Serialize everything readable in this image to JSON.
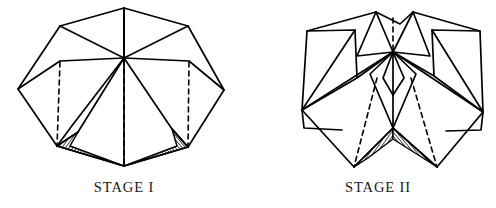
{
  "document": {
    "title": "Origami Folding Stages",
    "background_color": "#ffffff",
    "line_color": "#000000",
    "hatch_color": "#2b2b2b"
  },
  "captions": {
    "left": "STAGE I",
    "right": "STAGE II"
  },
  "figures": [
    {
      "name": "stage-1-figure",
      "label": "STAGE I",
      "description": "Partially folded polyhedral net with central hub, six radiating panels, three dashed valley-fold lines and two hatched shaded triangles at the bottom",
      "hub": [
        124,
        58
      ],
      "top_apex": [
        124,
        8
      ],
      "bottom_apex": [
        124,
        166
      ],
      "left_tip": [
        18,
        89
      ],
      "right_tip": [
        224,
        90
      ],
      "solid_polylines": [
        [
          [
            124,
            8
          ],
          [
            60,
            26
          ],
          [
            124,
            58
          ]
        ],
        [
          [
            124,
            8
          ],
          [
            188,
            26
          ],
          [
            124,
            58
          ]
        ],
        [
          [
            124,
            8
          ],
          [
            124,
            58
          ]
        ],
        [
          [
            60,
            26
          ],
          [
            18,
            89
          ]
        ],
        [
          [
            188,
            26
          ],
          [
            224,
            90
          ]
        ],
        [
          [
            18,
            89
          ],
          [
            57,
            146
          ]
        ],
        [
          [
            224,
            90
          ],
          [
            188,
            147
          ]
        ],
        [
          [
            18,
            89
          ],
          [
            59,
            60
          ]
        ],
        [
          [
            224,
            90
          ],
          [
            189,
            60
          ]
        ],
        [
          [
            59,
            60
          ],
          [
            124,
            58
          ]
        ],
        [
          [
            189,
            60
          ],
          [
            124,
            58
          ]
        ],
        [
          [
            59,
            60
          ],
          [
            60,
            62
          ]
        ],
        [
          [
            124,
            58
          ],
          [
            71,
            127
          ]
        ],
        [
          [
            124,
            58
          ],
          [
            78,
            132
          ]
        ],
        [
          [
            124,
            58
          ],
          [
            172,
            129
          ]
        ],
        [
          [
            124,
            58
          ],
          [
            124,
            166
          ]
        ],
        [
          [
            71,
            127
          ],
          [
            57,
            146
          ]
        ],
        [
          [
            172,
            129
          ],
          [
            188,
            147
          ]
        ],
        [
          [
            57,
            146
          ],
          [
            124,
            166
          ]
        ],
        [
          [
            188,
            147
          ],
          [
            124,
            166
          ]
        ],
        [
          [
            57,
            146
          ],
          [
            78,
            132
          ]
        ],
        [
          [
            172,
            129
          ],
          [
            186,
            146
          ]
        ]
      ],
      "dashed_lines": [
        [
          [
            60,
            62
          ],
          [
            57,
            146
          ]
        ],
        [
          [
            124,
            60
          ],
          [
            124,
            166
          ]
        ],
        [
          [
            189,
            62
          ],
          [
            188,
            147
          ]
        ]
      ],
      "hatched_triangles": [
        [
          [
            78,
            132
          ],
          [
            57,
            146
          ],
          [
            124,
            166
          ]
        ],
        [
          [
            172,
            129
          ],
          [
            188,
            147
          ],
          [
            124,
            166
          ]
        ]
      ]
    },
    {
      "name": "stage-2-figure",
      "label": "STAGE II",
      "description": "Further folded configuration with two outer square panels, inner peaked panels, two dashed valley-fold lines and a dark hatched V-shaped trough at bottom center",
      "hub": [
        393,
        52
      ],
      "left_square": [
        [
          307,
          31
        ],
        [
          355,
          30
        ],
        [
          357,
          78
        ],
        [
          302,
          110
        ]
      ],
      "right_square": [
        [
          432,
          30
        ],
        [
          480,
          31
        ],
        [
          483,
          112
        ],
        [
          434,
          76
        ]
      ],
      "solid_polylines": [
        [
          [
            376,
            12
          ],
          [
            393,
            52
          ]
        ],
        [
          [
            376,
            12
          ],
          [
            307,
            31
          ]
        ],
        [
          [
            307,
            31
          ],
          [
            355,
            30
          ]
        ],
        [
          [
            355,
            30
          ],
          [
            357,
            78
          ]
        ],
        [
          [
            357,
            78
          ],
          [
            302,
            110
          ]
        ],
        [
          [
            302,
            110
          ],
          [
            307,
            31
          ]
        ],
        [
          [
            302,
            110
          ],
          [
            355,
            30
          ]
        ],
        [
          [
            302,
            110
          ],
          [
            393,
            52
          ]
        ],
        [
          [
            376,
            12
          ],
          [
            393,
            52
          ]
        ],
        [
          [
            376,
            12
          ],
          [
            400,
            24
          ]
        ],
        [
          [
            400,
            24
          ],
          [
            413,
            12
          ]
        ],
        [
          [
            413,
            12
          ],
          [
            393,
            52
          ]
        ],
        [
          [
            413,
            12
          ],
          [
            480,
            31
          ]
        ],
        [
          [
            480,
            31
          ],
          [
            432,
            30
          ]
        ],
        [
          [
            432,
            30
          ],
          [
            434,
            76
          ]
        ],
        [
          [
            434,
            76
          ],
          [
            483,
            112
          ]
        ],
        [
          [
            483,
            112
          ],
          [
            480,
            31
          ]
        ],
        [
          [
            483,
            112
          ],
          [
            432,
            30
          ]
        ],
        [
          [
            483,
            112
          ],
          [
            393,
            52
          ]
        ],
        [
          [
            302,
            110
          ],
          [
            354,
            167
          ]
        ],
        [
          [
            354,
            167
          ],
          [
            393,
            128
          ]
        ],
        [
          [
            393,
            128
          ],
          [
            393,
            52
          ]
        ],
        [
          [
            393,
            52
          ],
          [
            370,
            74
          ]
        ],
        [
          [
            370,
            74
          ],
          [
            354,
            167
          ]
        ],
        [
          [
            393,
            52
          ],
          [
            416,
            74
          ]
        ],
        [
          [
            416,
            74
          ],
          [
            437,
            167
          ]
        ],
        [
          [
            437,
            167
          ],
          [
            393,
            128
          ]
        ],
        [
          [
            483,
            112
          ],
          [
            437,
            167
          ]
        ],
        [
          [
            302,
            110
          ],
          [
            304,
            128
          ]
        ],
        [
          [
            304,
            128
          ],
          [
            342,
            130
          ]
        ],
        [
          [
            483,
            112
          ],
          [
            481,
            130
          ]
        ],
        [
          [
            481,
            130
          ],
          [
            446,
            131
          ]
        ],
        [
          [
            393,
            52
          ],
          [
            385,
            75
          ]
        ],
        [
          [
            385,
            75
          ],
          [
            393,
            93
          ]
        ],
        [
          [
            393,
            52
          ],
          [
            402,
            75
          ]
        ],
        [
          [
            402,
            75
          ],
          [
            393,
            93
          ]
        ]
      ],
      "dashed_lines": [
        [
          [
            393,
            18
          ],
          [
            393,
            52
          ]
        ],
        [
          [
            377,
            76
          ],
          [
            354,
            167
          ]
        ],
        [
          [
            410,
            76
          ],
          [
            437,
            167
          ]
        ]
      ],
      "hatched_triangles": [
        [
          [
            393,
            128
          ],
          [
            354,
            167
          ],
          [
            393,
            137
          ]
        ],
        [
          [
            393,
            128
          ],
          [
            437,
            167
          ],
          [
            393,
            137
          ]
        ]
      ]
    }
  ]
}
